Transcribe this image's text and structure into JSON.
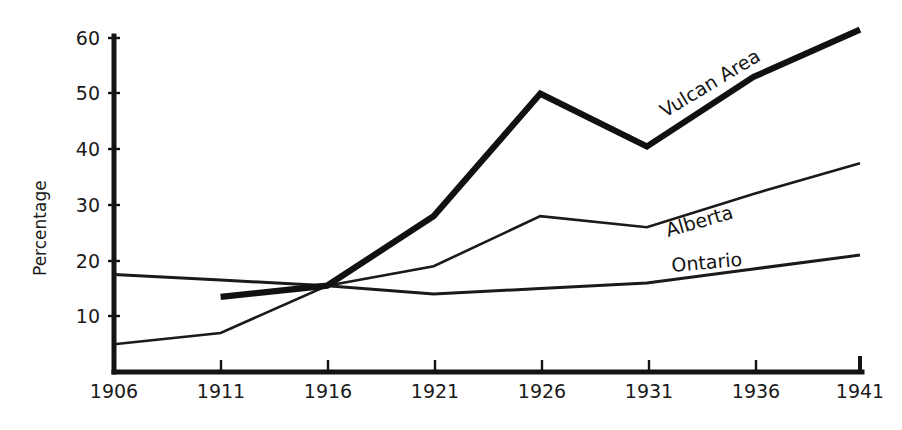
{
  "chart_data": {
    "type": "line",
    "title": "",
    "xlabel": "",
    "ylabel": "Percentage",
    "x": [
      1906,
      1911,
      1916,
      1921,
      1926,
      1931,
      1936,
      1941
    ],
    "categories": [
      "1906",
      "1911",
      "1916",
      "1921",
      "1926",
      "1931",
      "1936",
      "1941"
    ],
    "xlim": [
      1906,
      1941
    ],
    "ylim": [
      0,
      60
    ],
    "yticks": [
      10,
      20,
      30,
      40,
      50,
      60
    ],
    "ytick_labels": [
      "10",
      "20",
      "30",
      "40",
      "50",
      "60"
    ],
    "grid": false,
    "legend_position": "inline-labels",
    "series": [
      {
        "name": "Vulcan Area",
        "label": "Vulcan Area",
        "line_weight": "thick",
        "x": [
          1911,
          1916,
          1921,
          1926,
          1931,
          1936,
          1941
        ],
        "values": [
          13.5,
          15.5,
          28,
          50,
          40.5,
          53,
          61.5
        ]
      },
      {
        "name": "Alberta",
        "label": "Alberta",
        "line_weight": "thin",
        "x": [
          1906,
          1911,
          1916,
          1921,
          1926,
          1931,
          1936,
          1941
        ],
        "values": [
          5,
          7,
          15.5,
          19,
          28,
          26,
          32,
          37.5
        ]
      },
      {
        "name": "Ontario",
        "label": "Ontario",
        "line_weight": "medium",
        "x": [
          1906,
          1911,
          1916,
          1921,
          1926,
          1931,
          1936,
          1941
        ],
        "values": [
          17.5,
          16.5,
          15.5,
          14,
          15,
          16,
          18.5,
          21
        ]
      }
    ]
  },
  "axis": {
    "y_title": "Percentage",
    "y_tick_10": "10",
    "y_tick_20": "20",
    "y_tick_30": "30",
    "y_tick_40": "40",
    "y_tick_50": "50",
    "y_tick_60": "60",
    "x_tick_1906": "1906",
    "x_tick_1911": "1911",
    "x_tick_1916": "1916",
    "x_tick_1921": "1921",
    "x_tick_1926": "1926",
    "x_tick_1931": "1931",
    "x_tick_1936": "1936",
    "x_tick_1941": "1941"
  },
  "labels": {
    "vulcan": "Vulcan Area",
    "alberta": "Alberta",
    "ontario": "Ontario"
  },
  "colors": {
    "ink": "#111111",
    "background": "#ffffff"
  }
}
